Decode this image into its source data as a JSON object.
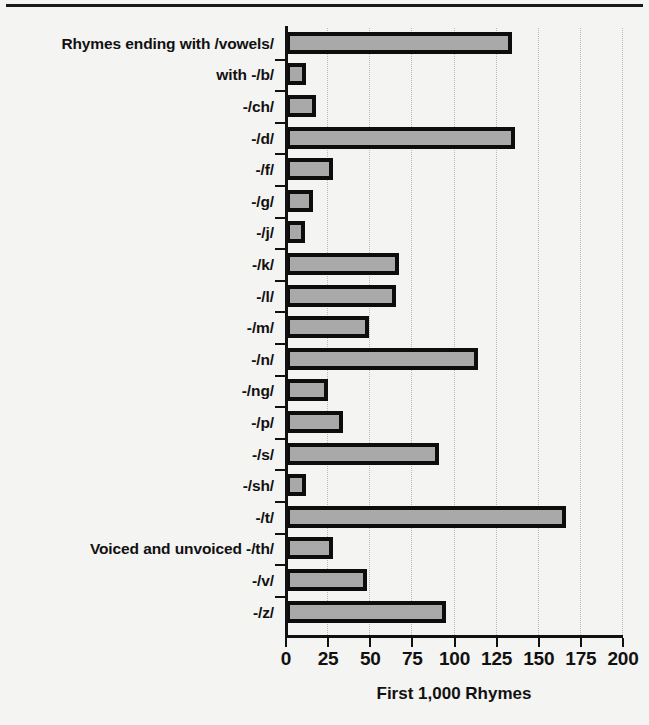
{
  "chart_data": {
    "type": "bar",
    "orientation": "horizontal",
    "title": "",
    "xlabel": "First 1,000 Rhymes",
    "ylabel": "",
    "xlim": [
      0,
      200
    ],
    "xticks": [
      0,
      25,
      50,
      75,
      100,
      125,
      150,
      175,
      200
    ],
    "grid": "vertical-dotted",
    "legend": "none",
    "categories": [
      "Rhymes ending with /vowels/",
      "with -/b/",
      "-/ch/",
      "-/d/",
      "-/f/",
      "-/g/",
      "-/j/",
      "-/k/",
      "-/l/",
      "-/m/",
      "-/n/",
      "-/ng/",
      "-/p/",
      "-/s/",
      "-/sh/",
      "-/t/",
      "Voiced and unvoiced -/th/",
      "-/v/",
      "-/z/"
    ],
    "values": [
      134,
      12,
      18,
      136,
      28,
      16,
      11,
      67,
      65,
      49,
      114,
      25,
      34,
      91,
      12,
      166,
      28,
      48,
      95
    ],
    "bar_fill_color": "#a9a9a9",
    "bar_edge_color": "#0d0d0d",
    "background_color": "#f4f4f2"
  },
  "axis": {
    "x_tick_labels": [
      "0",
      "25",
      "50",
      "75",
      "100",
      "125",
      "150",
      "175",
      "200"
    ],
    "x_axis_title": "First 1,000 Rhymes"
  }
}
